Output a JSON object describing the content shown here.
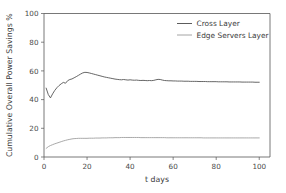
{
  "chart_data": {
    "type": "line",
    "title": "",
    "xlabel": "t days",
    "ylabel": "Cumulative Overall Power Savings %",
    "xlim": [
      0,
      105
    ],
    "ylim": [
      0,
      100
    ],
    "xticks": [
      0,
      20,
      40,
      60,
      80,
      100
    ],
    "yticks": [
      0,
      20,
      40,
      60,
      80,
      100
    ],
    "xtick_labels": [
      "0",
      "20",
      "40",
      "60",
      "80",
      "100"
    ],
    "ytick_labels": [
      "0",
      "20",
      "40",
      "60",
      "80",
      "100"
    ],
    "grid": false,
    "legend_position": "top-right",
    "colors": {
      "cross_layer": "#4a4a4a",
      "edge_servers_layer": "#9a9a9a",
      "axis": "#555555",
      "background": "#ffffff"
    },
    "x": [
      1,
      2,
      3,
      4,
      5,
      6,
      7,
      8,
      9,
      10,
      11,
      12,
      13,
      14,
      15,
      16,
      17,
      18,
      19,
      20,
      21,
      22,
      23,
      24,
      25,
      26,
      27,
      28,
      29,
      30,
      31,
      32,
      33,
      34,
      35,
      36,
      37,
      38,
      39,
      40,
      41,
      42,
      43,
      44,
      45,
      46,
      47,
      48,
      49,
      50,
      51,
      52,
      53,
      54,
      55,
      56,
      57,
      58,
      59,
      60,
      61,
      62,
      63,
      64,
      65,
      66,
      67,
      68,
      69,
      70,
      71,
      72,
      73,
      74,
      75,
      76,
      77,
      78,
      79,
      80,
      81,
      82,
      83,
      84,
      85,
      86,
      87,
      88,
      89,
      90,
      91,
      92,
      93,
      94,
      95,
      96,
      97,
      98,
      99,
      100
    ],
    "series": [
      {
        "name": "Cross Layer",
        "color": "#4a4a4a",
        "values": [
          48.0,
          43.5,
          41.2,
          44.0,
          46.4,
          48.3,
          49.8,
          51.0,
          52.0,
          51.4,
          53.2,
          54.0,
          54.4,
          55.2,
          56.0,
          56.9,
          57.8,
          58.6,
          59.0,
          58.9,
          58.6,
          58.2,
          57.8,
          57.4,
          57.0,
          56.6,
          56.2,
          55.8,
          55.5,
          55.2,
          54.9,
          54.6,
          54.3,
          54.1,
          53.9,
          53.8,
          54.0,
          53.8,
          53.6,
          53.8,
          53.6,
          53.5,
          53.6,
          53.4,
          53.3,
          53.4,
          53.3,
          53.2,
          53.3,
          53.2,
          53.4,
          53.8,
          54.1,
          54.0,
          53.6,
          53.3,
          53.2,
          53.1,
          53.1,
          53.0,
          53.0,
          52.9,
          52.9,
          52.9,
          52.8,
          52.8,
          52.8,
          52.7,
          52.7,
          52.7,
          52.7,
          52.6,
          52.6,
          52.6,
          52.6,
          52.5,
          52.5,
          52.5,
          52.5,
          52.5,
          52.4,
          52.4,
          52.4,
          52.4,
          52.4,
          52.3,
          52.3,
          52.3,
          52.3,
          52.3,
          52.3,
          52.2,
          52.2,
          52.2,
          52.2,
          52.2,
          52.2,
          52.1,
          52.1,
          52.1
        ]
      },
      {
        "name": "Edge Servers Layer",
        "color": "#9a9a9a",
        "values": [
          6.0,
          7.2,
          8.0,
          8.6,
          9.2,
          9.7,
          10.2,
          10.7,
          11.2,
          11.6,
          12.0,
          12.3,
          12.6,
          12.8,
          12.9,
          13.0,
          13.0,
          13.0,
          13.0,
          13.0,
          13.1,
          13.1,
          13.1,
          13.2,
          13.2,
          13.2,
          13.3,
          13.3,
          13.3,
          13.4,
          13.4,
          13.4,
          13.5,
          13.5,
          13.5,
          13.6,
          13.6,
          13.6,
          13.6,
          13.6,
          13.6,
          13.6,
          13.6,
          13.6,
          13.5,
          13.5,
          13.5,
          13.5,
          13.5,
          13.5,
          13.5,
          13.5,
          13.5,
          13.5,
          13.5,
          13.5,
          13.4,
          13.4,
          13.4,
          13.4,
          13.4,
          13.4,
          13.4,
          13.4,
          13.4,
          13.4,
          13.4,
          13.4,
          13.4,
          13.4,
          13.4,
          13.4,
          13.4,
          13.3,
          13.3,
          13.3,
          13.3,
          13.3,
          13.3,
          13.3,
          13.3,
          13.3,
          13.3,
          13.3,
          13.3,
          13.3,
          13.3,
          13.3,
          13.3,
          13.3,
          13.3,
          13.3,
          13.3,
          13.3,
          13.3,
          13.3,
          13.3,
          13.3,
          13.3,
          13.3
        ]
      }
    ],
    "legend": [
      {
        "label": "Cross Layer",
        "color": "#4a4a4a"
      },
      {
        "label": "Edge Servers Layer",
        "color": "#9a9a9a"
      }
    ]
  }
}
